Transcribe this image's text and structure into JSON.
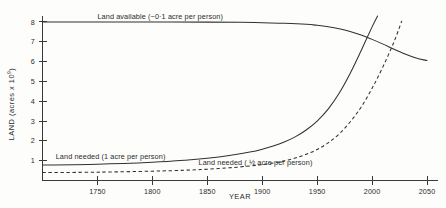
{
  "chart_data": {
    "type": "line",
    "title": "",
    "xlabel": "YEAR",
    "ylabel": "LAND (acres x 10",
    "ylabel_exponent": "9",
    "ylabel_close": ")",
    "xlim": [
      1700,
      2060
    ],
    "ylim": [
      0,
      8.3
    ],
    "grid": false,
    "legend_position": "inline-annotations",
    "xticks": [
      1750,
      1800,
      1850,
      1900,
      1950,
      2000,
      2050
    ],
    "xtick_labels": [
      "1750",
      "1800",
      "1850",
      "1900",
      "1950",
      "2000",
      "2050"
    ],
    "yticks": [
      1,
      2,
      3,
      4,
      5,
      6,
      7,
      8
    ],
    "ytick_labels": [
      "1",
      "2",
      "3",
      "4",
      "5",
      "6",
      "7",
      "8"
    ],
    "annotations": [
      {
        "name": "land-available-label",
        "text": "Land available (~0·1 acre per person)",
        "x": 1750,
        "y": 8.15
      },
      {
        "name": "land-needed-one-acre-label",
        "text": "Land needed (1 acre per person)",
        "x": 1712,
        "y": 1.08
      },
      {
        "name": "land-needed-half-acre-label",
        "text": "Land needed ( ½ acre per person)",
        "x": 1842,
        "y": 0.77
      }
    ],
    "series": [
      {
        "name": "Land available (~0.1 acre per person)",
        "style": "solid",
        "points": [
          [
            1700,
            8.0
          ],
          [
            1750,
            8.0
          ],
          [
            1800,
            8.0
          ],
          [
            1850,
            7.99
          ],
          [
            1880,
            7.98
          ],
          [
            1900,
            7.96
          ],
          [
            1920,
            7.93
          ],
          [
            1940,
            7.88
          ],
          [
            1950,
            7.83
          ],
          [
            1960,
            7.76
          ],
          [
            1970,
            7.66
          ],
          [
            1980,
            7.52
          ],
          [
            1990,
            7.34
          ],
          [
            2000,
            7.12
          ],
          [
            2010,
            6.88
          ],
          [
            2020,
            6.62
          ],
          [
            2030,
            6.38
          ],
          [
            2040,
            6.18
          ],
          [
            2050,
            6.05
          ]
        ]
      },
      {
        "name": "Land needed (1 acre per person)",
        "style": "solid",
        "points": [
          [
            1700,
            0.78
          ],
          [
            1750,
            0.82
          ],
          [
            1800,
            0.92
          ],
          [
            1830,
            1.02
          ],
          [
            1850,
            1.12
          ],
          [
            1870,
            1.26
          ],
          [
            1890,
            1.45
          ],
          [
            1900,
            1.58
          ],
          [
            1910,
            1.74
          ],
          [
            1920,
            1.94
          ],
          [
            1930,
            2.2
          ],
          [
            1940,
            2.55
          ],
          [
            1950,
            3.0
          ],
          [
            1960,
            3.6
          ],
          [
            1970,
            4.4
          ],
          [
            1980,
            5.4
          ],
          [
            1990,
            6.55
          ],
          [
            2000,
            7.75
          ],
          [
            2005,
            8.3
          ]
        ]
      },
      {
        "name": "Land needed (1/2 acre per person)",
        "style": "dashed",
        "points": [
          [
            1700,
            0.4
          ],
          [
            1750,
            0.42
          ],
          [
            1800,
            0.47
          ],
          [
            1830,
            0.52
          ],
          [
            1850,
            0.57
          ],
          [
            1870,
            0.64
          ],
          [
            1890,
            0.74
          ],
          [
            1900,
            0.8
          ],
          [
            1910,
            0.88
          ],
          [
            1920,
            0.99
          ],
          [
            1930,
            1.13
          ],
          [
            1940,
            1.32
          ],
          [
            1950,
            1.56
          ],
          [
            1960,
            1.9
          ],
          [
            1970,
            2.35
          ],
          [
            1980,
            2.95
          ],
          [
            1990,
            3.7
          ],
          [
            2000,
            4.65
          ],
          [
            2010,
            5.75
          ],
          [
            2020,
            7.0
          ],
          [
            2027,
            8.05
          ]
        ]
      }
    ]
  }
}
